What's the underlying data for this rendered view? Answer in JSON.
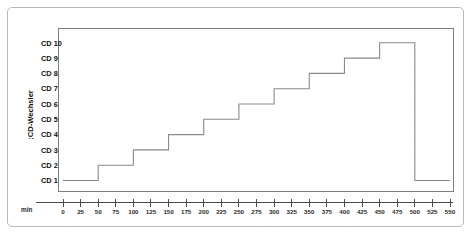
{
  "chart_data": {
    "type": "line",
    "title": "",
    "subtitle": "",
    "xlabel": "min",
    "ylabel": ":CD-Wechsler",
    "x_unit_label": "min",
    "xlim": [
      0,
      550
    ],
    "xticks": [
      0,
      25,
      50,
      75,
      100,
      125,
      150,
      175,
      200,
      225,
      250,
      275,
      300,
      325,
      350,
      375,
      400,
      425,
      450,
      475,
      500,
      525,
      550
    ],
    "xtick_labels": [
      "0",
      "25",
      "50",
      "75",
      "100",
      "125",
      "150",
      "175",
      "200",
      "225",
      "250",
      "275",
      "300",
      "325",
      "350",
      "375",
      "400",
      "425",
      "450",
      "475",
      "500",
      "525",
      "550"
    ],
    "ytick_labels": [
      "CD 1",
      "CD 2",
      "CD 3",
      "CD 4",
      "CD 5",
      "CD 6",
      "CD 7",
      "CD 8",
      "CD 9",
      "CD 10"
    ],
    "ylim": [
      1,
      10
    ],
    "grid": false,
    "legend": null,
    "line_color": "#8a8a8a",
    "step_style": "post",
    "series": [
      {
        "name": "CD-Wechsler",
        "x": [
          0,
          50,
          50,
          100,
          100,
          150,
          150,
          200,
          200,
          250,
          250,
          300,
          300,
          350,
          350,
          400,
          400,
          450,
          450,
          500,
          500,
          550
        ],
        "y": [
          1,
          1,
          2,
          2,
          3,
          3,
          4,
          4,
          5,
          5,
          6,
          6,
          7,
          7,
          8,
          8,
          9,
          9,
          10,
          10,
          1,
          1
        ]
      }
    ],
    "steps": [
      {
        "cd": "CD 1",
        "level": 1,
        "from_min": 0,
        "to_min": 50
      },
      {
        "cd": "CD 2",
        "level": 2,
        "from_min": 50,
        "to_min": 100
      },
      {
        "cd": "CD 3",
        "level": 3,
        "from_min": 100,
        "to_min": 150
      },
      {
        "cd": "CD 4",
        "level": 4,
        "from_min": 150,
        "to_min": 200
      },
      {
        "cd": "CD 5",
        "level": 5,
        "from_min": 200,
        "to_min": 250
      },
      {
        "cd": "CD 6",
        "level": 6,
        "from_min": 250,
        "to_min": 300
      },
      {
        "cd": "CD 7",
        "level": 7,
        "from_min": 300,
        "to_min": 350
      },
      {
        "cd": "CD 8",
        "level": 8,
        "from_min": 350,
        "to_min": 400
      },
      {
        "cd": "CD 9",
        "level": 9,
        "from_min": 400,
        "to_min": 450
      },
      {
        "cd": "CD 10",
        "level": 10,
        "from_min": 450,
        "to_min": 500
      },
      {
        "cd": "CD 1",
        "level": 1,
        "from_min": 500,
        "to_min": 550
      }
    ]
  },
  "colors": {
    "line": "#8a8a8a",
    "axis": "#4b4b4b",
    "plot_border": "#7d7d7d",
    "figure_border": "#b9b9b9",
    "text": "#111111",
    "background": "#ffffff"
  }
}
